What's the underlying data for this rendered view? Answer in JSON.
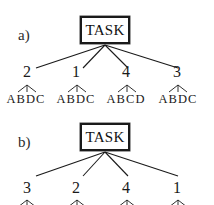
{
  "figure": {
    "background_color": "#ffffff",
    "ink_color": "#1a1a1a",
    "width": 214,
    "height": 205
  },
  "panels": [
    {
      "id": "a",
      "label": "a)",
      "root": {
        "label": "TASK",
        "box_x": 80,
        "box_y": 16,
        "box_w": 50,
        "box_h": 28
      },
      "edge_origin": {
        "x": 105,
        "y": 45
      },
      "leaves": [
        {
          "number": "2",
          "x": 27,
          "letters": "ABDC",
          "letters_x": 2,
          "fan_x": 18
        },
        {
          "number": "1",
          "x": 76,
          "letters": "ABDC",
          "letters_x": 51,
          "fan_x": 67
        },
        {
          "number": "4",
          "x": 126,
          "letters": "ABCD",
          "letters_x": 101,
          "fan_x": 117
        },
        {
          "number": "3",
          "x": 177,
          "letters": "ABDC",
          "letters_x": 152,
          "fan_x": 168
        }
      ]
    },
    {
      "id": "b",
      "label": "b)",
      "root": {
        "label": "TASK",
        "box_x": 80,
        "box_y": 13,
        "box_w": 50,
        "box_h": 28
      },
      "edge_origin": {
        "x": 105,
        "y": 42
      },
      "leaves": [
        {
          "number": "3",
          "x": 27,
          "letters": "",
          "letters_x": 2,
          "fan_x": 18
        },
        {
          "number": "2",
          "x": 76,
          "letters": "",
          "letters_x": 51,
          "fan_x": 67
        },
        {
          "number": "4",
          "x": 126,
          "letters": "",
          "letters_x": 101,
          "fan_x": 117
        },
        {
          "number": "1",
          "x": 177,
          "letters": "",
          "letters_x": 152,
          "fan_x": 168
        }
      ]
    }
  ]
}
